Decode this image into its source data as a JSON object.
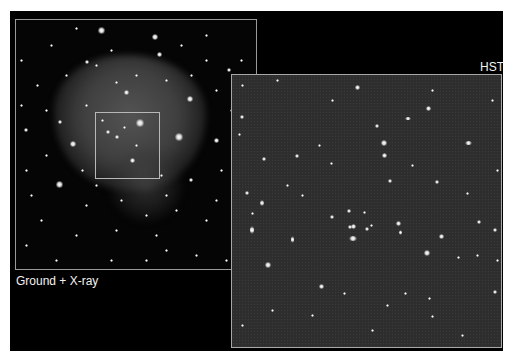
{
  "figure": {
    "background_color": "#ffffff",
    "plate_color": "#000000",
    "panels": {
      "ground": {
        "label": "Ground + X-ray",
        "frame_color": "#9a9a9a",
        "zoom_box_color": "#b8b8b8",
        "stars": [
          [
            85,
            10,
            7
          ],
          [
            139,
            17,
            6
          ],
          [
            143,
            34,
            5
          ],
          [
            71,
            42,
            4
          ],
          [
            110,
            72,
            5
          ],
          [
            21,
            65,
            3
          ],
          [
            124,
            103,
            8
          ],
          [
            174,
            79,
            6
          ],
          [
            163,
            117,
            8
          ],
          [
            57,
            124,
            6
          ],
          [
            43,
            164,
            7
          ],
          [
            116,
            140,
            5
          ],
          [
            213,
            50,
            4
          ],
          [
            200,
            120,
            5
          ],
          [
            44,
            102,
            4
          ],
          [
            100,
            62,
            3
          ],
          [
            165,
            25,
            3
          ],
          [
            190,
            15,
            3
          ],
          [
            35,
            25,
            3
          ],
          [
            60,
            8,
            3
          ],
          [
            225,
            40,
            3
          ],
          [
            10,
            110,
            4
          ],
          [
            30,
            135,
            3
          ],
          [
            15,
            175,
            3
          ],
          [
            80,
            165,
            3
          ],
          [
            145,
            155,
            3
          ],
          [
            175,
            160,
            4
          ],
          [
            205,
            150,
            3
          ],
          [
            190,
            200,
            3
          ],
          [
            220,
            220,
            3
          ],
          [
            10,
            225,
            3
          ],
          [
            60,
            215,
            3
          ],
          [
            100,
            210,
            3
          ],
          [
            140,
            215,
            3
          ],
          [
            160,
            190,
            3
          ],
          [
            5,
            40,
            3
          ],
          [
            95,
            30,
            3
          ],
          [
            120,
            55,
            3
          ],
          [
            150,
            60,
            3
          ],
          [
            190,
            40,
            3
          ],
          [
            215,
            90,
            3
          ],
          [
            5,
            85,
            3
          ],
          [
            30,
            90,
            3
          ],
          [
            70,
            85,
            3
          ],
          [
            92,
            112,
            4
          ],
          [
            101,
            117,
            4
          ],
          [
            108,
            107,
            3
          ],
          [
            86,
            100,
            3
          ],
          [
            120,
            125,
            3
          ],
          [
            66,
            150,
            3
          ],
          [
            150,
            175,
            3
          ],
          [
            180,
            235,
            3
          ],
          [
            40,
            240,
            3
          ],
          [
            130,
            240,
            3
          ],
          [
            230,
            130,
            3
          ],
          [
            228,
            170,
            3
          ],
          [
            200,
            180,
            3
          ],
          [
            25,
            200,
            3
          ],
          [
            70,
            185,
            3
          ],
          [
            105,
            180,
            3
          ],
          [
            130,
            195,
            3
          ],
          [
            50,
            55,
            3
          ],
          [
            80,
            45,
            3
          ],
          [
            175,
            55,
            3
          ],
          [
            200,
            70,
            3
          ],
          [
            232,
            115,
            3
          ],
          [
            10,
            150,
            3
          ],
          [
            210,
            240,
            3
          ],
          [
            150,
            230,
            3
          ],
          [
            95,
            240,
            3
          ]
        ]
      },
      "hst": {
        "label": "HST",
        "frame_color": "#a8a8a8",
        "background_color": "#2e2e2e",
        "stars": [
          [
            10,
            42,
            4
          ],
          [
            125,
            12,
            5
          ],
          [
            196,
            33,
            5
          ],
          [
            176,
            43,
            6,
            3
          ],
          [
            236,
            68,
            7,
            4
          ],
          [
            145,
            51,
            4
          ],
          [
            152,
            68,
            6
          ],
          [
            152,
            80,
            5
          ],
          [
            7,
            59,
            3
          ],
          [
            65,
            81,
            4
          ],
          [
            32,
            84,
            4
          ],
          [
            99,
            88,
            3
          ],
          [
            158,
            106,
            4
          ],
          [
            205,
            107,
            4
          ],
          [
            15,
            118,
            4
          ],
          [
            30,
            128,
            4,
            6
          ],
          [
            20,
            138,
            3
          ],
          [
            117,
            136,
            4
          ],
          [
            100,
            142,
            4
          ],
          [
            132,
            137,
            3
          ],
          [
            121,
            163,
            8,
            5
          ],
          [
            121,
            151,
            5
          ],
          [
            135,
            154,
            4
          ],
          [
            139,
            150,
            3
          ],
          [
            20,
            155,
            4,
            8
          ],
          [
            60,
            164,
            3,
            7
          ],
          [
            166,
            148,
            5
          ],
          [
            168,
            157,
            3,
            5
          ],
          [
            195,
            178,
            6
          ],
          [
            209,
            161,
            5
          ],
          [
            247,
            147,
            4
          ],
          [
            263,
            155,
            4
          ],
          [
            36,
            190,
            6
          ],
          [
            263,
            217,
            4
          ],
          [
            173,
            218,
            3
          ],
          [
            118,
            152,
            4
          ],
          [
            197,
            223,
            3
          ],
          [
            89,
            211,
            5
          ],
          [
            112,
            218,
            3
          ],
          [
            155,
            230,
            3
          ],
          [
            226,
            182,
            3
          ],
          [
            245,
            180,
            3
          ],
          [
            265,
            185,
            3
          ],
          [
            40,
            235,
            3
          ],
          [
            80,
            240,
            3
          ],
          [
            200,
            241,
            3
          ],
          [
            230,
            260,
            3
          ],
          [
            140,
            255,
            3
          ],
          [
            10,
            250,
            3
          ],
          [
            55,
            110,
            3
          ],
          [
            87,
            70,
            3
          ],
          [
            200,
            15,
            3
          ],
          [
            45,
            5,
            3
          ],
          [
            10,
            10,
            3
          ],
          [
            260,
            25,
            3
          ],
          [
            265,
            95,
            3
          ],
          [
            100,
            25,
            3
          ],
          [
            235,
            118,
            3
          ],
          [
            70,
            120,
            3
          ],
          [
            180,
            90,
            3
          ]
        ]
      }
    }
  }
}
